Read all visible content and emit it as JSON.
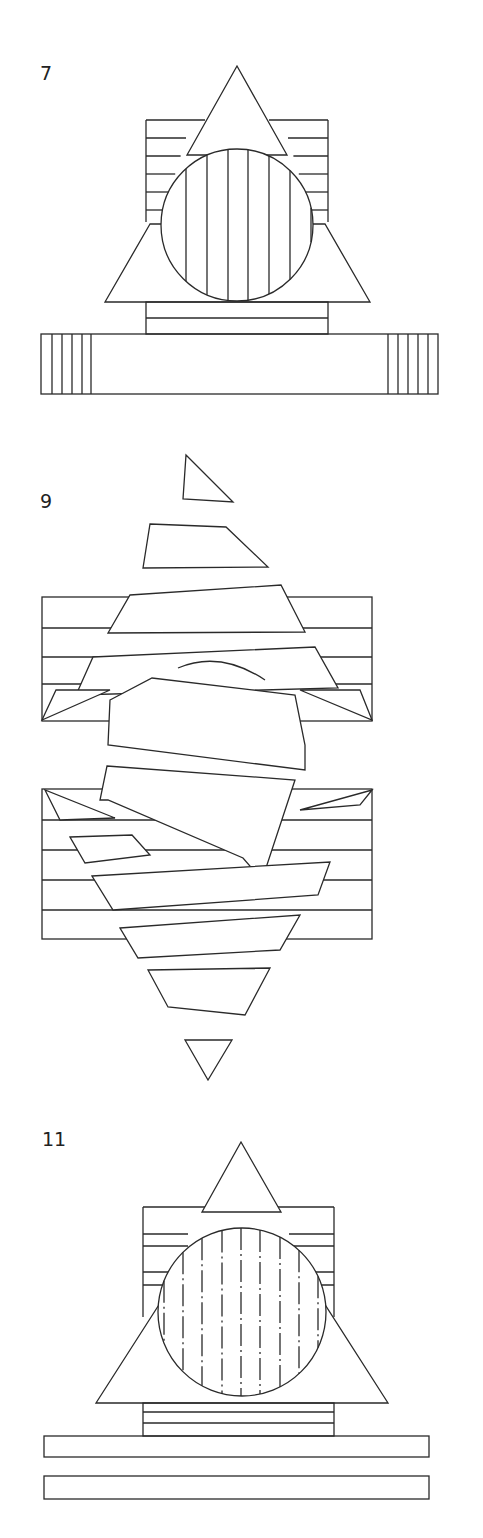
{
  "figures": [
    {
      "label": "7"
    },
    {
      "label": "9"
    },
    {
      "label": "11"
    }
  ],
  "colors": {
    "stroke": "#2a2a2a",
    "background": "#ffffff"
  },
  "fig7": {
    "hatched_rect": {
      "x": 146,
      "y": 120,
      "w": 182,
      "h": 102
    },
    "hatch_rows_y": [
      138,
      156,
      174,
      192,
      210
    ],
    "top_triangle": "237,66 187,155 287,155",
    "big_triangle": "150,224 105,302 370,302 325,224",
    "circle": {
      "cx": 237,
      "cy": 225,
      "r": 76
    },
    "circle_vlines_x": [
      186,
      207,
      228,
      248,
      269,
      290,
      311
    ],
    "base_block": {
      "x": 146,
      "y": 302,
      "w": 182,
      "h": 32
    },
    "base_mid_y": 318,
    "bar": {
      "x": 41,
      "y": 334,
      "w": 397,
      "h": 60
    },
    "bar_vlines_left": [
      52,
      62,
      72,
      82,
      91
    ],
    "bar_vlines_right": [
      388,
      398,
      408,
      418,
      428
    ]
  },
  "fig9": {
    "polys": [
      "186,455 233,502 183,499",
      "150,524 226,527 268,567 143,568",
      "130,595 281,585 305,632 108,633",
      "93,657 315,647 338,688 76,695",
      "152,678 295,695 305,769 108,769 120,720",
      "120,755 236,762 303,795 90,808 52,760 42,810",
      "107,766 295,780 265,884 243,858 108,800",
      "45,790 120,790 115,820 60,820",
      "70,840 132,835 165,875 85,890",
      "92,876 330,862 318,895 113,910",
      "120,928 300,915 280,950 138,958",
      "148,970 270,968 245,1015 168,1007",
      "185,1040 232,1040 208,1080"
    ],
    "frame_top": {
      "x": 42,
      "y": 597,
      "w": 330,
      "h": 124
    },
    "frame_bottom": {
      "x": 42,
      "y": 789,
      "w": 330,
      "h": 150
    },
    "rows_top": [
      628,
      657,
      684
    ],
    "rows_bottom": [
      820,
      850,
      880,
      910
    ],
    "arc": "178,668 Q220,650 265,680"
  },
  "fig11": {
    "tower": {
      "x": 143,
      "y": 1207,
      "w": 191,
      "h": 110
    },
    "tower_rows_y": [
      1234,
      1246,
      1272,
      1285
    ],
    "top_triangle": "241,1142 202,1212 281,1212",
    "big_triangle": "162,1300 96,1403 388,1403 322,1300",
    "circle": {
      "cx": 242,
      "cy": 1312,
      "r": 84
    },
    "circle_vlines_x": [
      164,
      183,
      202,
      222,
      241,
      260,
      280,
      299,
      318
    ],
    "dash_rows_y": [
      1278,
      1333,
      1350
    ],
    "base_block": {
      "x": 143,
      "y": 1403,
      "w": 191,
      "h": 33
    },
    "base_rows_y": [
      1412,
      1423
    ],
    "bar1": {
      "x": 44,
      "y": 1436,
      "w": 385,
      "h": 21
    },
    "bar2": {
      "x": 44,
      "y": 1476,
      "w": 385,
      "h": 23
    }
  }
}
